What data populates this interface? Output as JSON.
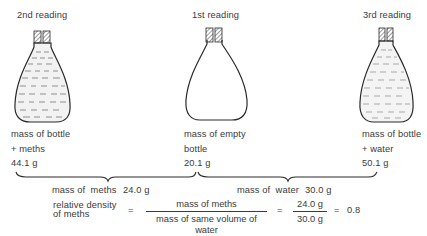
{
  "readings": [
    {
      "id": "second",
      "label": "2nd reading",
      "contents": "meths",
      "filled": true,
      "caption_line1": "mass of bottle",
      "caption_line2": "+ meths",
      "mass": "44.1 g"
    },
    {
      "id": "first",
      "label": "1st reading",
      "contents": "empty",
      "filled": false,
      "caption_line1": "mass of empty",
      "caption_line2": "bottle",
      "mass": "20.1 g"
    },
    {
      "id": "third",
      "label": "3rd reading",
      "contents": "water",
      "filled": true,
      "caption_line1": "mass of bottle",
      "caption_line2": "+ water",
      "mass": "50.1 g"
    }
  ],
  "differences": {
    "meths": {
      "label": "mass of  meths",
      "value": "24.0 g"
    },
    "water": {
      "label": "mass of  water",
      "value": "30.0 g"
    }
  },
  "formula": {
    "lhs_line1": "relative density",
    "lhs_line2": "of meths",
    "eq1": "=",
    "ratio_numerator": "mass of meths",
    "ratio_denominator": "mass of same volume of water",
    "eq2": "=",
    "value_numerator": "24.0 g",
    "value_denominator": "30.0 g",
    "eq3": "=",
    "result": "0.8"
  },
  "colors": {
    "ink": "#3a3a3a",
    "liquid_fill": "#f2f2f2",
    "background": "#ffffff"
  }
}
